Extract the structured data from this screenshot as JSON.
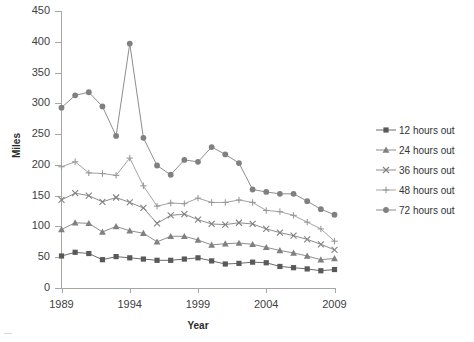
{
  "chart_data": {
    "type": "line",
    "title": "",
    "xlabel": "Year",
    "ylabel": "Miles",
    "xlim": [
      1989,
      2009
    ],
    "ylim": [
      0,
      450
    ],
    "ytick_labels": [
      "450",
      "400",
      "350",
      "300",
      "250",
      "200",
      "150",
      "100",
      "50",
      "0"
    ],
    "ytick_values": [
      450,
      400,
      350,
      300,
      250,
      200,
      150,
      100,
      50,
      0
    ],
    "xtick_labels": [
      "1989",
      "1994",
      "1999",
      "2004",
      "2009"
    ],
    "xtick_values": [
      1989,
      1994,
      1999,
      2004,
      2009
    ],
    "grid": false,
    "legend_position": "right",
    "x": [
      1989,
      1990,
      1991,
      1992,
      1993,
      1994,
      1995,
      1996,
      1997,
      1998,
      1999,
      2000,
      2001,
      2002,
      2003,
      2004,
      2005,
      2006,
      2007,
      2008,
      2009
    ],
    "series": [
      {
        "name": "12 hours out",
        "label": "12 hours out",
        "marker": "square",
        "color": "#595959",
        "values": [
          52,
          58,
          56,
          46,
          51,
          49,
          47,
          45,
          45,
          47,
          49,
          44,
          39,
          40,
          42,
          41,
          35,
          33,
          31,
          28,
          30
        ]
      },
      {
        "name": "24 hours out",
        "label": "24 hours out",
        "marker": "triangle",
        "color": "#808080",
        "values": [
          95,
          106,
          105,
          91,
          100,
          93,
          89,
          75,
          84,
          84,
          78,
          70,
          72,
          73,
          71,
          66,
          61,
          57,
          52,
          46,
          48
        ]
      },
      {
        "name": "36 hours out",
        "label": "36 hours out",
        "marker": "x",
        "color": "#808080",
        "values": [
          143,
          154,
          150,
          140,
          147,
          139,
          130,
          105,
          118,
          120,
          111,
          104,
          103,
          106,
          104,
          96,
          90,
          85,
          79,
          71,
          62
        ]
      },
      {
        "name": "48 hours out",
        "label": "48 hours out",
        "marker": "plus",
        "color": "#999999",
        "values": [
          197,
          205,
          187,
          186,
          183,
          211,
          166,
          133,
          138,
          137,
          146,
          139,
          139,
          143,
          139,
          126,
          124,
          118,
          107,
          96,
          76
        ]
      },
      {
        "name": "72 hours out",
        "label": "72 hours out",
        "marker": "circle",
        "color": "#808080",
        "values": [
          293,
          313,
          318,
          295,
          247,
          397,
          244,
          199,
          184,
          208,
          205,
          229,
          217,
          203,
          160,
          156,
          153,
          153,
          141,
          128,
          119
        ]
      }
    ]
  },
  "legend": {
    "items": [
      {
        "label": "12 hours out"
      },
      {
        "label": "24 hours out"
      },
      {
        "label": "36 hours out"
      },
      {
        "label": "48 hours out"
      },
      {
        "label": "72 hours out"
      }
    ]
  },
  "axes": {
    "y_title": "Miles",
    "x_title": "Year"
  }
}
